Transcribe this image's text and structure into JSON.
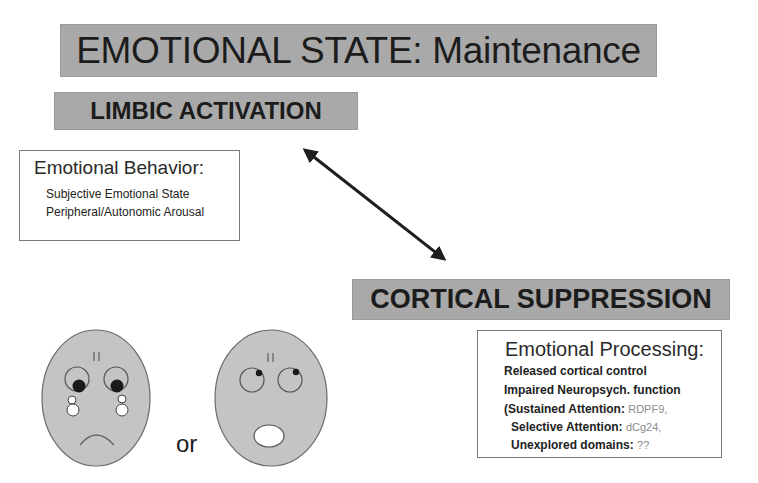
{
  "title": "EMOTIONAL STATE: Maintenance",
  "limbic": {
    "label": "LIMBIC ACTIVATION"
  },
  "cortical": {
    "label": "CORTICAL SUPPRESSION"
  },
  "behavior_box": {
    "heading": "Emotional Behavior:",
    "lines": [
      "Subjective Emotional State",
      "Peripheral/Autonomic Arousal"
    ]
  },
  "processing_box": {
    "heading": "Emotional Processing:",
    "lines": [
      "Released cortical control",
      "Impaired Neuropsych. function"
    ],
    "domains": [
      {
        "label": "(Sustained Attention",
        "value": "RDPF9,"
      },
      {
        "label": "Selective Attention",
        "value": "dCg24,"
      },
      {
        "label": "Unexplored domains",
        "value": "??"
      }
    ]
  },
  "arrow": {
    "type": "double-headed",
    "from": "limbic-activation",
    "to": "cortical-suppression"
  },
  "faces": {
    "left": "sad-crying-face",
    "connector": "or",
    "right": "surprised-face"
  },
  "colors": {
    "box_fill": "#a9a9a9",
    "face_fill": "#c4c4c4",
    "text": "#1c1c1c",
    "muted_value": "#8a8a8a"
  }
}
